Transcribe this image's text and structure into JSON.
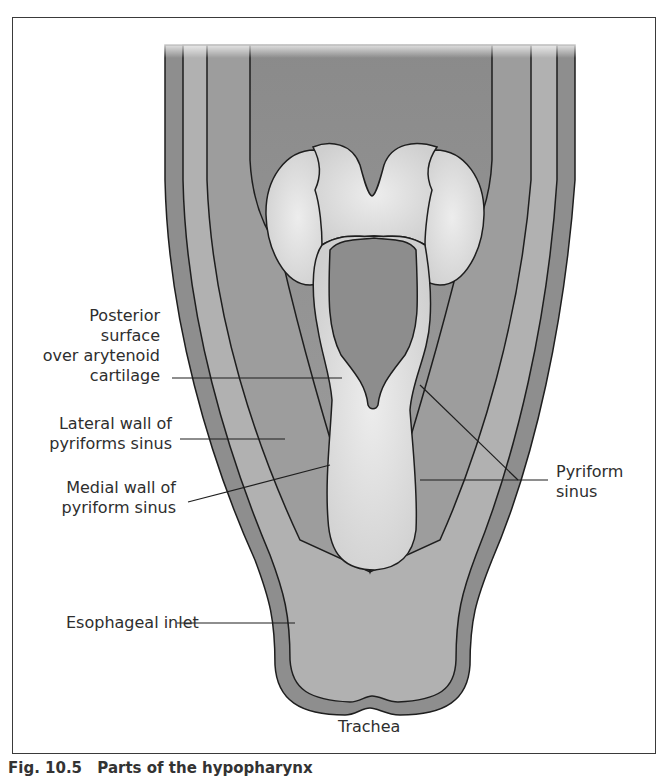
{
  "figure": {
    "type": "anatomical-illustration",
    "labels": {
      "posterior_surface": [
        "Posterior",
        "surface",
        "over arytenoid",
        "cartilage"
      ],
      "lateral_wall": [
        "Lateral wall of",
        "pyriforms sinus"
      ],
      "medial_wall": [
        "Medial wall of",
        "pyriform sinus"
      ],
      "pyriform_sinus": [
        "Pyriform",
        "sinus"
      ],
      "esophageal_inlet": "Esophageal inlet",
      "trachea": "Trachea"
    },
    "caption": {
      "number": "Fig. 10.5",
      "text": "Parts of the hypopharynx"
    },
    "colors": {
      "outer_wall": "#8f8f8f",
      "mid_wall": "#b2b2b2",
      "inner_lumen": "#9a9a9a",
      "cartilage": "#d8d8d8",
      "outline": "#1e1e1e",
      "background": "#ffffff"
    }
  }
}
